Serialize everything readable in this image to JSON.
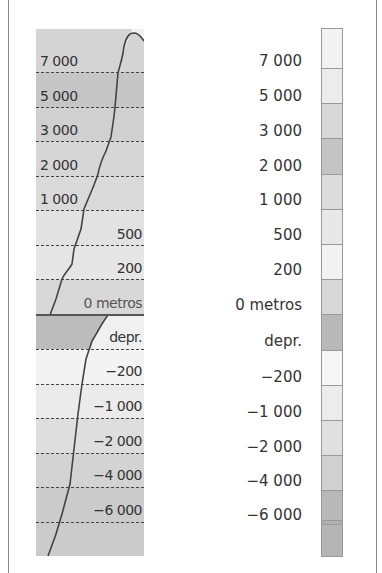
{
  "profile": {
    "bands": [
      {
        "label": "7000",
        "color": "#d2d2d2",
        "align": "left"
      },
      {
        "label": "5000",
        "color": "#c4c4c4",
        "align": "left"
      },
      {
        "label": "3000",
        "color": "#d0d0d0",
        "align": "left"
      },
      {
        "label": "2000",
        "color": "#d6d6d6",
        "align": "left"
      },
      {
        "label": "1000",
        "color": "#dadada",
        "align": "left"
      },
      {
        "label": "500",
        "color": "#e2e2e2",
        "align": "right"
      },
      {
        "label": "200",
        "color": "#e6e6e6",
        "align": "right"
      },
      {
        "label": "0 metros",
        "color": "#d8d8d8",
        "align": "right"
      },
      {
        "label": "depr.",
        "color": "#bdbdbd",
        "align": "right"
      },
      {
        "label": "−200",
        "color": "#f2f2f2",
        "align": "right"
      },
      {
        "label": "−1 000",
        "color": "#ebebeb",
        "align": "right"
      },
      {
        "label": "−2 000",
        "color": "#dedede",
        "align": "right"
      },
      {
        "label": "−4 000",
        "color": "#d3d3d3",
        "align": "right"
      },
      {
        "label": "−6 000",
        "color": "#cbcbcb",
        "align": "right"
      }
    ],
    "line_color": "#444444"
  },
  "legend": {
    "items": [
      {
        "label": "7 000",
        "color": "#eeeeee"
      },
      {
        "label": "5 000",
        "color": "#e6e6e6"
      },
      {
        "label": "3 000",
        "color": "#d6d6d6"
      },
      {
        "label": "2 000",
        "color": "#c4c4c4"
      },
      {
        "label": "1 000",
        "color": "#dcdcdc"
      },
      {
        "label": "500",
        "color": "#e8e8e8"
      },
      {
        "label": "200",
        "color": "#f3f3f3"
      },
      {
        "label": "0 metros",
        "color": "#d8d8d8"
      },
      {
        "label": "depr.",
        "color": "#b8b8b8"
      },
      {
        "label": "−200",
        "color": "#f6f6f6"
      },
      {
        "label": "−1 000",
        "color": "#ececec"
      },
      {
        "label": "−2 000",
        "color": "#e0e0e0"
      },
      {
        "label": "−4 000",
        "color": "#d0d0d0"
      },
      {
        "label": "−6 000",
        "color": "#b8b8b8"
      }
    ],
    "top_swatch_color": "#f2f2f2",
    "bottom_swatch_color": "#b5b5b5"
  },
  "labels": {
    "p0": "7 000",
    "p1": "5 000",
    "p2": "3 000",
    "p3": "2 000",
    "p4": "1 000",
    "p5": "500",
    "p6": "200",
    "p7": "0 metros",
    "p8": "depr.",
    "p9": "−200",
    "p10": "−1 000",
    "p11": "−2 000",
    "p12": "−4 000",
    "p13": "−6 000"
  }
}
